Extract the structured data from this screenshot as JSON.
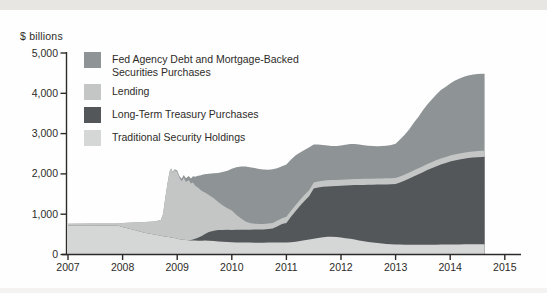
{
  "chart": {
    "y_axis_title": "$ billions"
  },
  "legend": {
    "items": [
      {
        "label": "Fed Agency Debt and Mortgage-Backed Securities Purchases",
        "color": "#8e9495"
      },
      {
        "label": "Lending",
        "color": "#c3c6c5"
      },
      {
        "label": "Long-Term Treasury Purchases",
        "color": "#545759"
      },
      {
        "label": "Traditional Security Holdings",
        "color": "#d5d7d6"
      }
    ]
  },
  "chart_data": {
    "type": "area",
    "stacked": true,
    "title": "",
    "ylabel": "$ billions",
    "xlabel": "",
    "unit": "$ billions",
    "xlim": [
      2007,
      2015.35
    ],
    "ylim": [
      0,
      5000
    ],
    "grid": false,
    "legend_position": "upper-left",
    "x_ticks": [
      2007,
      2008,
      2009,
      2010,
      2011,
      2012,
      2013,
      2014,
      2015
    ],
    "x_tick_labels": [
      "2007",
      "2008",
      "2009",
      "2010",
      "2011",
      "2012",
      "2013",
      "2014",
      "2015"
    ],
    "y_ticks": [
      0,
      1000,
      2000,
      3000,
      4000,
      5000
    ],
    "y_tick_labels": [
      "0",
      "1,000",
      "2,000",
      "3,000",
      "4,000",
      "5,000"
    ],
    "x": [
      2007.0,
      2007.5,
      2007.92,
      2008.0,
      2008.2,
      2008.4,
      2008.58,
      2008.7,
      2008.74,
      2008.78,
      2008.82,
      2008.86,
      2008.89,
      2008.92,
      2008.95,
      2009.0,
      2009.04,
      2009.08,
      2009.12,
      2009.16,
      2009.21,
      2009.25,
      2009.29,
      2009.33,
      2009.38,
      2009.42,
      2009.46,
      2009.5,
      2009.58,
      2009.67,
      2009.75,
      2009.83,
      2009.92,
      2010.0,
      2010.08,
      2010.17,
      2010.25,
      2010.33,
      2010.42,
      2010.5,
      2010.58,
      2010.67,
      2010.75,
      2010.83,
      2010.92,
      2011.0,
      2011.08,
      2011.17,
      2011.25,
      2011.33,
      2011.42,
      2011.5,
      2011.58,
      2011.67,
      2011.75,
      2011.83,
      2011.92,
      2012.0,
      2012.08,
      2012.17,
      2012.25,
      2012.33,
      2012.42,
      2012.5,
      2012.58,
      2012.67,
      2012.75,
      2012.83,
      2012.92,
      2013.0,
      2013.08,
      2013.17,
      2013.25,
      2013.33,
      2013.42,
      2013.5,
      2013.58,
      2013.67,
      2013.75,
      2013.83,
      2013.92,
      2014.0,
      2014.08,
      2014.17,
      2014.25,
      2014.33,
      2014.42,
      2014.5,
      2014.58,
      2014.63
    ],
    "series": [
      {
        "name": "Traditional Security Holdings",
        "color": "#d5d7d6",
        "values": [
          720,
          720,
          712,
          685,
          612,
          542,
          495,
          465,
          455,
          448,
          440,
          430,
          422,
          415,
          408,
          392,
          380,
          372,
          366,
          360,
          355,
          350,
          347,
          345,
          343,
          342,
          343,
          344,
          341,
          333,
          325,
          317,
          310,
          305,
          301,
          298,
          296,
          295,
          294,
          294,
          294,
          295,
          296,
          297,
          298,
          300,
          305,
          318,
          332,
          352,
          372,
          390,
          412,
          428,
          438,
          440,
          433,
          420,
          405,
          390,
          370,
          350,
          330,
          312,
          297,
          283,
          271,
          261,
          254,
          249,
          246,
          244,
          243,
          242,
          241,
          241,
          242,
          243,
          244,
          246,
          247,
          249,
          250,
          251,
          252,
          253,
          253,
          254,
          254,
          254
        ]
      },
      {
        "name": "Long-Term Treasury Purchases",
        "color": "#545759",
        "values": [
          0,
          0,
          0,
          0,
          0,
          0,
          0,
          0,
          0,
          0,
          0,
          0,
          0,
          0,
          0,
          0,
          0,
          0,
          0,
          0,
          3,
          10,
          25,
          45,
          72,
          98,
          122,
          156,
          214,
          257,
          280,
          293,
          302,
          305,
          311,
          316,
          319,
          321,
          324,
          328,
          330,
          340,
          350,
          400,
          460,
          480,
          625,
          762,
          878,
          978,
          1078,
          1250,
          1253,
          1252,
          1252,
          1255,
          1267,
          1285,
          1307,
          1328,
          1352,
          1375,
          1398,
          1418,
          1435,
          1452,
          1467,
          1479,
          1489,
          1499,
          1542,
          1591,
          1642,
          1696,
          1749,
          1801,
          1853,
          1902,
          1948,
          1989,
          2025,
          2056,
          2082,
          2104,
          2123,
          2139,
          2152,
          2161,
          2168,
          2171
        ]
      },
      {
        "name": "Lending",
        "color": "#c3c6c5",
        "values": [
          45,
          48,
          56,
          95,
          183,
          263,
          327,
          390,
          545,
          942,
          1310,
          1630,
          1708,
          1615,
          1687,
          1658,
          1525,
          1448,
          1539,
          1440,
          1487,
          1400,
          1418,
          1315,
          1245,
          1170,
          1105,
          1045,
          925,
          805,
          695,
          610,
          538,
          480,
          373,
          276,
          205,
          169,
          147,
          133,
          135,
          135,
          138,
          140,
          142,
          155,
          152,
          150,
          150,
          150,
          150,
          150,
          150,
          150,
          150,
          150,
          150,
          150,
          150,
          150,
          150,
          150,
          150,
          150,
          150,
          150,
          150,
          150,
          150,
          150,
          150,
          150,
          150,
          150,
          150,
          150,
          150,
          150,
          150,
          150,
          150,
          150,
          150,
          150,
          150,
          150,
          150,
          150,
          150,
          150
        ]
      },
      {
        "name": "Fed Agency Debt and Mortgage-Backed Securities Purchases",
        "color": "#8e9495",
        "values": [
          0,
          0,
          0,
          0,
          0,
          0,
          0,
          0,
          0,
          0,
          0,
          5,
          10,
          15,
          20,
          35,
          45,
          60,
          70,
          90,
          105,
          125,
          150,
          225,
          295,
          350,
          410,
          445,
          525,
          620,
          725,
          825,
          930,
          1040,
          1180,
          1290,
          1360,
          1380,
          1380,
          1370,
          1351,
          1335,
          1331,
          1303,
          1290,
          1300,
          1270,
          1235,
          1170,
          1110,
          1060,
          940,
          915,
          890,
          865,
          845,
          840,
          850,
          863,
          872,
          873,
          855,
          834,
          820,
          808,
          800,
          802,
          810,
          827,
          852,
          917,
          990,
          1075,
          1172,
          1280,
          1388,
          1475,
          1560,
          1633,
          1695,
          1743,
          1785,
          1828,
          1860,
          1885,
          1903,
          1910,
          1915,
          1913,
          1910
        ]
      }
    ]
  }
}
